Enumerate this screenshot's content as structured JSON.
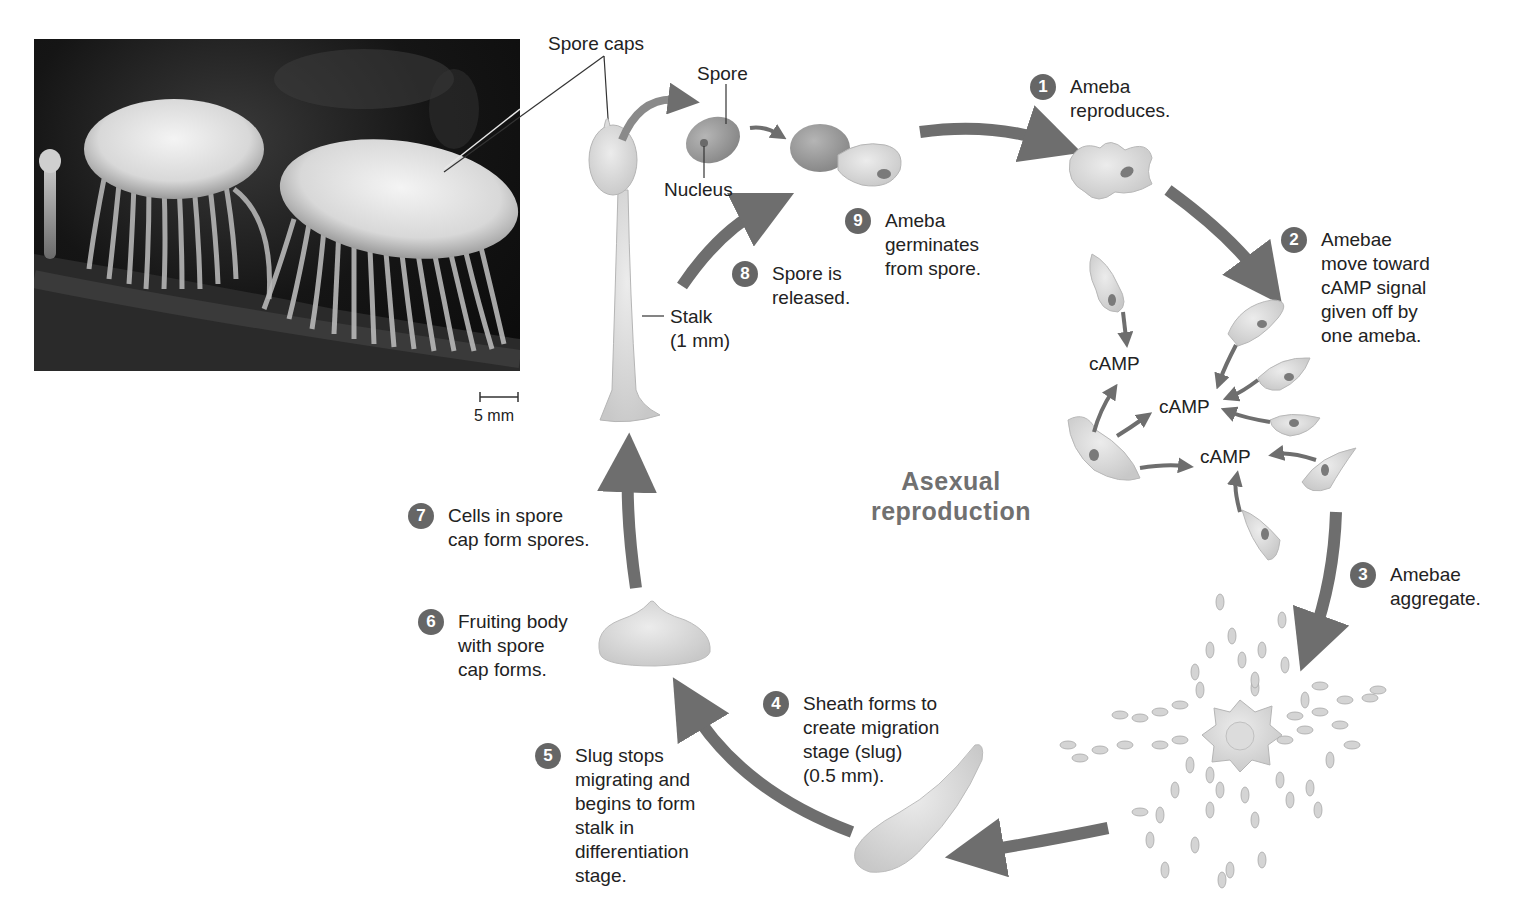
{
  "diagram": {
    "title": "Asexual\nreproduction",
    "type": "life-cycle",
    "colors": {
      "arrow": "#6e6e6e",
      "badge": "#666666",
      "cell_fill": "#d9d9d9",
      "title": "#707070"
    }
  },
  "photo": {
    "scale_bar": "5 mm",
    "callout": "Spore caps"
  },
  "fruiting_body_labels": {
    "spore_caps": "Spore caps",
    "spore": "Spore",
    "nucleus": "Nucleus",
    "stalk": "Stalk\n(1 mm)"
  },
  "camp_labels": [
    "cAMP",
    "cAMP",
    "cAMP"
  ],
  "steps": [
    {
      "num": "1",
      "text": "Ameba\nreproduces."
    },
    {
      "num": "2",
      "text": "Amebae\nmove toward\ncAMP signal\ngiven off by\none ameba."
    },
    {
      "num": "3",
      "text": "Amebae\naggregate."
    },
    {
      "num": "4",
      "text": "Sheath forms to\ncreate migration\nstage (slug)\n(0.5 mm)."
    },
    {
      "num": "5",
      "text": "Slug stops\nmigrating and\nbegins to form\nstalk in\ndifferentiation\nstage."
    },
    {
      "num": "6",
      "text": "Fruiting body\nwith spore\ncap forms."
    },
    {
      "num": "7",
      "text": "Cells in spore\ncap form spores."
    },
    {
      "num": "8",
      "text": "Spore is\nreleased."
    },
    {
      "num": "9",
      "text": "Ameba\ngerminates\nfrom spore."
    }
  ]
}
